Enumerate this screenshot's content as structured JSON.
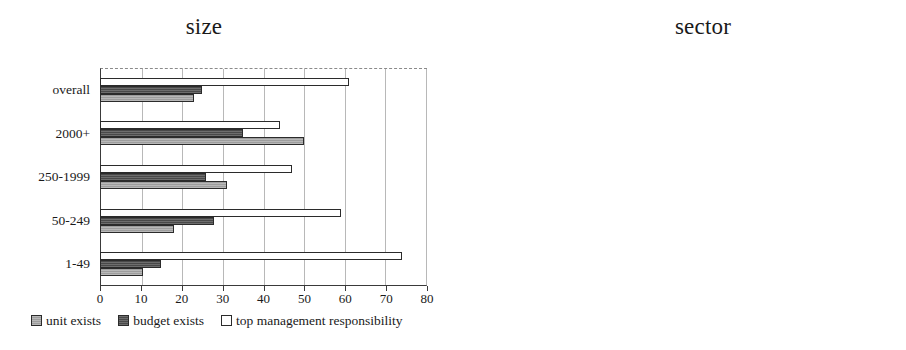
{
  "chart_data": [
    {
      "type": "bar",
      "orientation": "horizontal",
      "title": "size",
      "xlabel": "",
      "ylabel": "",
      "xlim": [
        0,
        80
      ],
      "xticks": [
        0,
        10,
        20,
        30,
        40,
        50,
        60,
        70,
        80
      ],
      "grid": true,
      "legend_position": "below",
      "categories": [
        "overall",
        "2000+",
        "250-1999",
        "50-249",
        "1-49"
      ],
      "series": [
        {
          "name": "unit exists",
          "color": "#9d9d9d",
          "values": [
            23,
            50,
            31,
            18,
            10.5
          ]
        },
        {
          "name": "budget exists",
          "color": "#494949",
          "values": [
            25,
            35,
            26,
            28,
            15
          ]
        },
        {
          "name": "top management responsibility",
          "color": "#ffffff",
          "values": [
            61,
            44,
            47,
            59,
            74
          ]
        }
      ]
    },
    {
      "type": "bar",
      "orientation": "horizontal",
      "title": "sector",
      "xlabel": "",
      "ylabel": "",
      "xlim": [
        0,
        80
      ],
      "xticks": [
        0,
        10,
        20,
        30,
        40,
        50,
        60,
        70,
        80
      ],
      "grid": true,
      "legend_position": "below",
      "categories": [
        "Services",
        "Biotech",
        "Pharmaceutical",
        "Vehicles",
        "Electr. Engin.",
        "Mechan. Engin.",
        "Chemical"
      ],
      "series": [
        {
          "name": "unit exists",
          "color": "#9d9d9d",
          "values": [
            33,
            17,
            8.5,
            17,
            16,
            24,
            24
          ]
        },
        {
          "name": "budget exists",
          "color": "#494949",
          "values": [
            32,
            27,
            37,
            15.5,
            20,
            24,
            18
          ]
        },
        {
          "name": "top management responsibility",
          "color": "#ffffff",
          "values": [
            77,
            63,
            56,
            37,
            51,
            52,
            51
          ]
        }
      ]
    }
  ],
  "legend": {
    "items": [
      {
        "label": "unit exists",
        "swatch": "s-unit"
      },
      {
        "label": "budget exists",
        "swatch": "s-budget"
      },
      {
        "label": "top management responsibility",
        "swatch": "s-top"
      }
    ]
  }
}
